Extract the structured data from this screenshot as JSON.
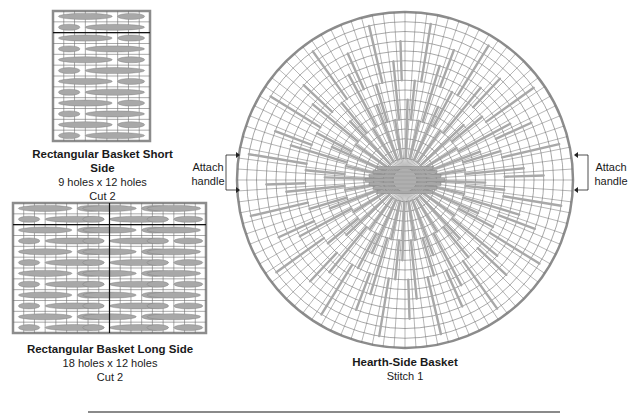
{
  "pieces": {
    "short_side": {
      "title": "Rectangular Basket Short Side",
      "size": "9 holes x 12 holes",
      "cut": "Cut 2",
      "cols": 9,
      "rows": 12,
      "box": {
        "x": 53,
        "y": 11,
        "w": 97,
        "h": 130
      }
    },
    "long_side": {
      "title": "Rectangular Basket Long Side",
      "size": "18 holes x 12 holes",
      "cut": "Cut 2",
      "cols": 18,
      "rows": 12,
      "box": {
        "x": 13,
        "y": 203,
        "w": 193,
        "h": 130
      }
    },
    "round": {
      "title": "Hearth-Side Basket",
      "subtitle": "Stitch 1",
      "center": {
        "x": 405,
        "y": 180
      },
      "radius": 168,
      "rings": 16,
      "spokes": 96
    }
  },
  "annotations": {
    "left_handle": {
      "line1": "Attach",
      "line2": "handle"
    },
    "right_handle": {
      "line1": "Attach",
      "line2": "handle"
    }
  },
  "colors": {
    "grid": "#6e6e6e",
    "stitch": "#a8a8a8",
    "stitch_edge": "#7a7a7a",
    "border": "#8c8c8c",
    "ink": "#1a1a1a"
  }
}
